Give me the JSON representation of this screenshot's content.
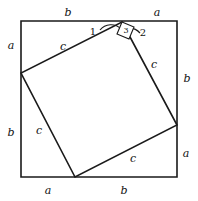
{
  "figure": {
    "canvas": {
      "width": 198,
      "height": 201
    },
    "stroke_color": "#1a1a1a",
    "fill_color": "#ffffff",
    "outer_square": {
      "name": "outer-square",
      "x": 21,
      "y": 21,
      "size": 156,
      "points": "21,21 177,21 177,177 21,177"
    },
    "inner_square": {
      "name": "inner-tilted-square",
      "points": "122,22 177,125 75,177 21,73",
      "vertices": [
        {
          "name": "top-vertex",
          "x": 122,
          "y": 22
        },
        {
          "name": "right-vertex",
          "x": 177,
          "y": 125
        },
        {
          "name": "bottom-vertex",
          "x": 75,
          "y": 177
        },
        {
          "name": "left-vertex",
          "x": 21,
          "y": 73
        }
      ]
    },
    "angle_arcs": [
      {
        "name": "angle-arc-1",
        "path": "M 100 30 A 14 14 0 0 1 121 29"
      },
      {
        "name": "angle-arc-2",
        "path": "M 125 29 A 14 14 0 0 1 140 33"
      }
    ],
    "right_angle_box": {
      "name": "right-angle-marker-3",
      "points": "122,22 134,27 129,39 117,34"
    },
    "side_labels": [
      {
        "name": "label-top-b",
        "text": "b",
        "x": 68,
        "y": 12
      },
      {
        "name": "label-top-a",
        "text": "a",
        "x": 157,
        "y": 12
      },
      {
        "name": "label-left-a",
        "text": "a",
        "x": 11,
        "y": 45
      },
      {
        "name": "label-left-b",
        "text": "b",
        "x": 11,
        "y": 132
      },
      {
        "name": "label-right-b",
        "text": "b",
        "x": 187,
        "y": 78
      },
      {
        "name": "label-right-a",
        "text": "a",
        "x": 186,
        "y": 153
      },
      {
        "name": "label-bottom-a",
        "text": "a",
        "x": 48,
        "y": 190
      },
      {
        "name": "label-bottom-b",
        "text": "b",
        "x": 124,
        "y": 190
      },
      {
        "name": "label-hyp-c-topleft",
        "text": "c",
        "x": 63,
        "y": 46
      },
      {
        "name": "label-hyp-c-topright",
        "text": "c",
        "x": 154,
        "y": 64
      },
      {
        "name": "label-hyp-c-bottomleft",
        "text": "c",
        "x": 39,
        "y": 130
      },
      {
        "name": "label-hyp-c-bottomright",
        "text": "c",
        "x": 133,
        "y": 158
      }
    ],
    "angle_labels": [
      {
        "name": "angle-label-1",
        "text": "1",
        "x": 93,
        "y": 32
      },
      {
        "name": "angle-label-2",
        "text": "2",
        "x": 143,
        "y": 33
      },
      {
        "name": "angle-label-3",
        "text": "3",
        "x": 123,
        "y": 32
      }
    ]
  }
}
